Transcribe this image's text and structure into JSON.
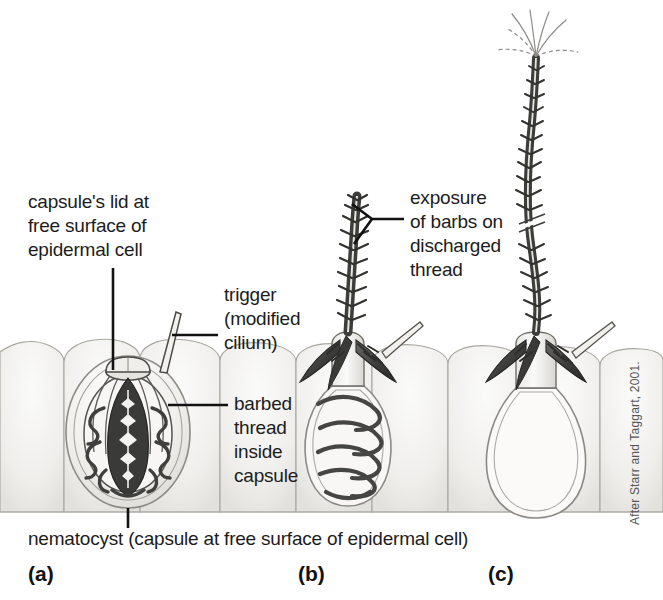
{
  "figure": {
    "title_caption": "nematocyst (capsule at free surface of epidermal cell)",
    "credit": "After Starr and Taggart, 2001.",
    "background_color": "#ffffff",
    "ink_color": "#1c1c1c",
    "tissue_fill": "#f2f1ef",
    "tissue_line": "#9a9892",
    "thread_color": "#4a4a4a"
  },
  "labels": {
    "capsule_lid": "capsule's lid at\nfree surface of\nepidermal cell",
    "trigger": "trigger\n(modified\ncilium)",
    "barbed_thread": "barbed\nthread\ninside\ncapsule",
    "exposure": "exposure\nof barbs on\ndischarged\nthread"
  },
  "panels": [
    {
      "letter": "(a)",
      "state": "undischarged capsule with coiled barbed thread inside"
    },
    {
      "letter": "(b)",
      "state": "partially discharged, thread everting with coils remaining"
    },
    {
      "letter": "(c)",
      "state": "fully discharged, empty capsule and long extended barbed thread"
    }
  ]
}
